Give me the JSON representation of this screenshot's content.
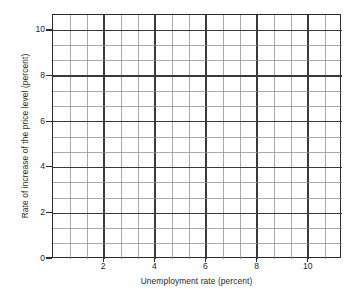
{
  "chart_data": {
    "type": "scatter",
    "title": "",
    "subtitle": "",
    "xlabel": "Unemployment rate (percent)",
    "ylabel": "Rate of increase of the price level (percent)",
    "xlim": [
      0,
      11.3
    ],
    "ylim": [
      0,
      10.7
    ],
    "xticks": [
      2,
      4,
      6,
      8,
      10
    ],
    "xtick_labels": [
      "2",
      "4",
      "6",
      "8",
      "10"
    ],
    "yticks": [
      0,
      2,
      4,
      6,
      8,
      10
    ],
    "ytick_labels": [
      "0",
      "2",
      "4",
      "6",
      "8",
      "10"
    ],
    "grid": true,
    "grid_minor": true,
    "grid_columns": 17,
    "grid_rows": 16,
    "grid_cell_x_units": 0.6667,
    "grid_cell_y_units": 0.6667,
    "legend": null,
    "legend_position": "none",
    "series": [],
    "x": [],
    "values": [],
    "annotations": [],
    "note": "Blank grid / empty plotting grid with no plotted data points or curves"
  },
  "axes": {
    "x": {
      "label": "Unemployment rate (percent)",
      "ticks": [
        {
          "value": 2,
          "label": "2"
        },
        {
          "value": 4,
          "label": "4"
        },
        {
          "value": 6,
          "label": "6"
        },
        {
          "value": 8,
          "label": "8"
        },
        {
          "value": 10,
          "label": "10"
        }
      ]
    },
    "y": {
      "label": "Rate of increase of the price level (percent)",
      "ticks": [
        {
          "value": 0,
          "label": "0"
        },
        {
          "value": 2,
          "label": "2"
        },
        {
          "value": 4,
          "label": "4"
        },
        {
          "value": 6,
          "label": "6"
        },
        {
          "value": 8,
          "label": "8"
        },
        {
          "value": 10,
          "label": "10"
        }
      ]
    }
  },
  "colors": {
    "axis": "#2b2b2b",
    "grid_major": "#3a3a3a",
    "grid_minor": "#8e8e8e",
    "background": "#ffffff",
    "text": "#1f1f1f"
  }
}
